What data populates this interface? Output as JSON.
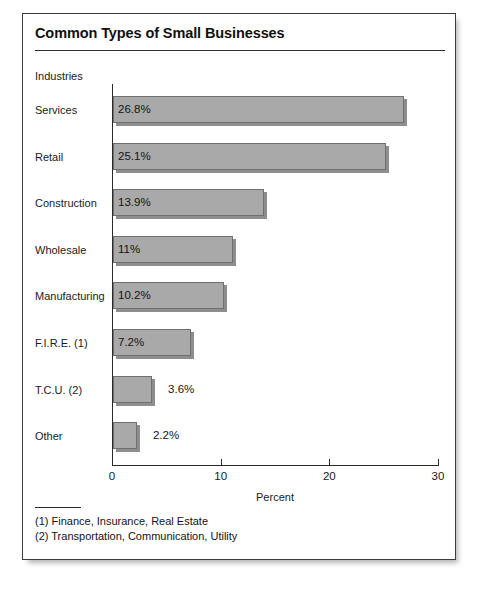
{
  "chart_data": {
    "type": "bar",
    "orientation": "horizontal",
    "title": "Common Types of Small Businesses",
    "xlabel": "Percent",
    "ylabel": "Industries",
    "xlim": [
      0,
      30
    ],
    "xticks": [
      0,
      10,
      20,
      30
    ],
    "xtick_labels": [
      "0",
      "10",
      "20",
      "30"
    ],
    "grid": false,
    "legend": null,
    "bar_color": "#a9a9a9",
    "bar_edge_color": "#6f6f6f",
    "categories": [
      "Services",
      "Retail",
      "Construction",
      "Wholesale",
      "Manufacturing",
      "F.I.R.E. (1)",
      "T.C.U. (2)",
      "Other"
    ],
    "values": [
      26.8,
      25.1,
      13.9,
      11,
      10.2,
      7.2,
      3.6,
      2.2
    ],
    "value_labels": [
      "26.8%",
      "25.1%",
      "13.9%",
      "11%",
      "10.2%",
      "7.2%",
      "3.6%",
      "2.2%"
    ],
    "label_placement": [
      "inside",
      "inside",
      "inside",
      "inside",
      "inside",
      "inside",
      "outside",
      "outside"
    ],
    "annotations": [
      "(1) Finance, Insurance, Real Estate",
      "(2) Transportation, Communication, Utility"
    ]
  }
}
